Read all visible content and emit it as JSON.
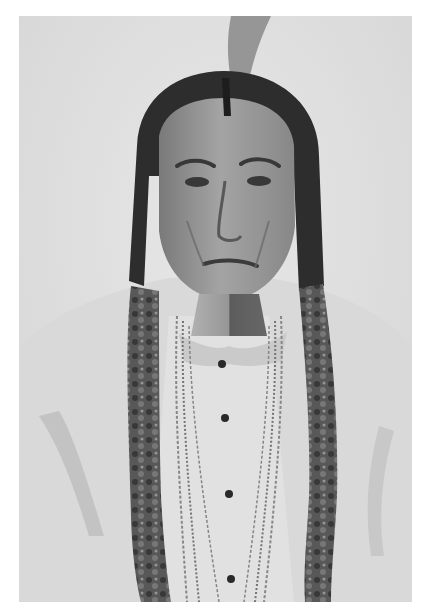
{
  "image": {
    "kind": "black-and-white portrait photograph",
    "frame": {
      "border_color": "#ffffff",
      "photo_left": 19,
      "photo_top": 16,
      "photo_width": 393,
      "photo_height": 586
    },
    "palette": {
      "background": "#e6e6e6",
      "hair": "#2b2b2b",
      "skin": "#9a9a9a",
      "skin_shadow": "#6e6e6e",
      "shirt": "#e2e2e2",
      "coat": "#dcdcdc",
      "braid": "#555555",
      "feather": "#8a8a8a"
    },
    "subject": {
      "description": "Man with center-parted dark hair, a single upright feather, two long wrapped braids, light collared shirt with dark buttons, multiple bead necklaces, and a pale fringed coat"
    }
  }
}
